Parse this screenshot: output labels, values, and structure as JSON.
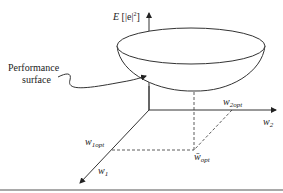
{
  "diagram": {
    "title": "Performance surface",
    "labels": {
      "vertical_axis": "E [|e|²]",
      "vertical_axis_main": "E",
      "vertical_axis_arg": "[|e|",
      "vertical_axis_exp": "2",
      "vertical_axis_close": "]",
      "surface_label_line1": "Performance",
      "surface_label_line2": "surface",
      "w2_axis": "w",
      "w2_sub": "2",
      "w1_axis": "w",
      "w1_sub": "1",
      "w2opt": "w",
      "w2opt_sub": "2opt",
      "w1opt": "w",
      "w1opt_sub": "1opt",
      "wopt": "w̄",
      "wopt_sub": "opt"
    },
    "colors": {
      "line": "#333333",
      "background": "#ffffff",
      "bottom_rule": "#555555"
    }
  }
}
